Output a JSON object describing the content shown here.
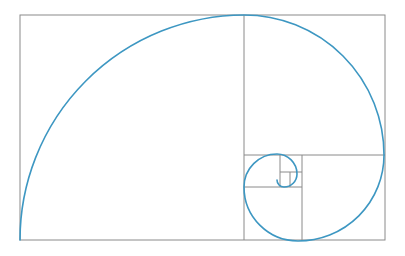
{
  "figure": {
    "type": "geometric-diagram",
    "canvas": {
      "width": 405,
      "height": 256,
      "background": "#ffffff"
    },
    "colors": {
      "grid_stroke": "#8a8a8a",
      "spiral_stroke": "#3d97c2",
      "background": "#ffffff"
    },
    "stroke_widths": {
      "grid": 1,
      "spiral": 1.6
    },
    "outer_rect": {
      "x": 20,
      "y": 15,
      "width": 365,
      "height": 225
    },
    "squares": [
      {
        "name": "square-1",
        "x": 20,
        "y": 15,
        "size": 225,
        "fib": 13,
        "arc_from": "bottom-left",
        "arc_to": "top-right"
      },
      {
        "name": "square-2",
        "x": 244,
        "y": 15,
        "size": 140,
        "fib": 8,
        "arc_from": "top-left",
        "arc_to": "bottom-right"
      },
      {
        "name": "square-3",
        "x": 244,
        "y": 155,
        "size": 86,
        "fib": 5,
        "arc_from": "top-right",
        "arc_to": "bottom-left"
      },
      {
        "name": "square-4",
        "x": 330,
        "y": 155,
        "size": 54,
        "fib": 3,
        "arc_from": "bottom-right",
        "arc_to": "top-left"
      },
      {
        "name": "square-5",
        "x": 297,
        "y": 155,
        "size": 33,
        "fib": 2,
        "arc_from": "bottom-left",
        "arc_to": "top-right"
      },
      {
        "name": "square-6",
        "x": 297,
        "y": 188,
        "size": 20,
        "fib": 1,
        "arc_from": "top-left",
        "arc_to": "bottom-right"
      },
      {
        "name": "square-7",
        "x": 277,
        "y": 175,
        "size": 13,
        "fib": 1,
        "arc_from": "top-right",
        "arc_to": "bottom-left"
      }
    ],
    "divider_lines": [
      {
        "name": "divider-vertical-main",
        "x1": 244,
        "y1": 15,
        "x2": 244,
        "y2": 240
      },
      {
        "name": "divider-horizontal-1",
        "x1": 244,
        "y1": 155,
        "x2": 385,
        "y2": 155
      },
      {
        "name": "divider-vertical-2",
        "x1": 302,
        "y1": 155,
        "x2": 302,
        "y2": 240
      },
      {
        "name": "divider-horizontal-2",
        "x1": 244,
        "y1": 187,
        "x2": 302,
        "y2": 187
      },
      {
        "name": "divider-vertical-3",
        "x1": 280,
        "y1": 155,
        "x2": 280,
        "y2": 187
      },
      {
        "name": "divider-horizontal-3",
        "x1": 280,
        "y1": 172,
        "x2": 302,
        "y2": 172
      },
      {
        "name": "divider-vertical-4",
        "x1": 290,
        "y1": 172,
        "x2": 290,
        "y2": 187
      }
    ],
    "spiral_path": "M 20 240 A 225 225 0 0 1 244 15 A 140 140 0 0 1 384 155 A 86 86 0 0 1 298 241 A 54 54 0 0 1 244 187 A 33 33 0 0 1 277 154 A 20 20 0 0 1 297 174 A 13 13 0 0 1 284 187 A 7 7 0 0 1 277 180",
    "caption": ""
  }
}
